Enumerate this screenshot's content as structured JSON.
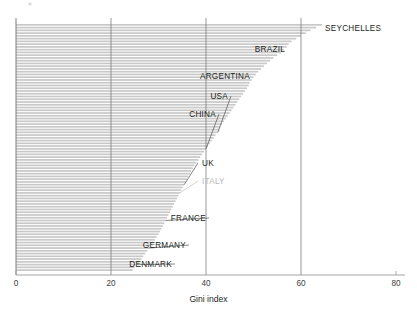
{
  "chart_data": {
    "type": "bar",
    "orientation": "horizontal",
    "title": "",
    "subtitle": "",
    "xlabel": "Gini index",
    "ylabel": "",
    "xlim": [
      0,
      80
    ],
    "xticks": [
      0,
      20,
      40,
      60,
      80
    ],
    "xtick_labels": [
      "0",
      "20",
      "40",
      "60",
      "80"
    ],
    "grid": "vertical gridlines at 20, 40, 60; left axis spine at 0",
    "legend": "none",
    "sorted": "descending by Gini index",
    "bar_color": "#c9c9c9",
    "note": "Each thin horizontal bar is one country; only selected countries are annotated with leader lines.",
    "annotations": [
      {
        "label": "SEYCHELLES",
        "value": 64.4,
        "dim": false
      },
      {
        "label": "BRAZIL",
        "value": 57.0,
        "dim": false
      },
      {
        "label": "ARGENTINA",
        "value": 49.0,
        "dim": false
      },
      {
        "label": "USA",
        "value": 42.5,
        "dim": false
      },
      {
        "label": "CHINA",
        "value": 40.0,
        "dim": false
      },
      {
        "label": "UK",
        "value": 35.4,
        "dim": false
      },
      {
        "label": "ITALY",
        "value": 34.5,
        "dim": true
      },
      {
        "label": "FRANCE",
        "value": 31.5,
        "dim": false
      },
      {
        "label": "GERMANY",
        "value": 28.0,
        "dim": false
      },
      {
        "label": "DENMARK",
        "value": 25.5,
        "dim": false
      }
    ],
    "values": [
      64.4,
      63.2,
      62.0,
      61.0,
      60.0,
      59.0,
      58.0,
      57.4,
      57.0,
      56.4,
      55.8,
      55.0,
      54.2,
      53.5,
      52.8,
      52.2,
      51.6,
      51.0,
      50.5,
      50.0,
      49.6,
      49.2,
      49.0,
      48.6,
      48.2,
      47.8,
      47.4,
      47.0,
      46.6,
      46.2,
      45.8,
      45.4,
      45.0,
      44.6,
      44.2,
      43.8,
      43.4,
      43.0,
      42.8,
      42.5,
      42.0,
      41.6,
      41.2,
      40.8,
      40.4,
      40.0,
      39.6,
      39.2,
      38.8,
      38.4,
      38.0,
      37.6,
      37.2,
      36.9,
      36.6,
      36.3,
      36.0,
      35.7,
      35.4,
      35.1,
      34.8,
      34.5,
      34.2,
      33.9,
      33.6,
      33.3,
      33.0,
      32.7,
      32.4,
      32.1,
      31.8,
      31.5,
      31.2,
      30.9,
      30.6,
      30.3,
      30.0,
      29.6,
      29.2,
      28.8,
      28.4,
      28.0,
      27.6,
      27.2,
      26.8,
      26.4,
      26.0,
      25.5,
      25.0,
      24.6
    ]
  },
  "axis": {
    "title": "Gini index"
  }
}
